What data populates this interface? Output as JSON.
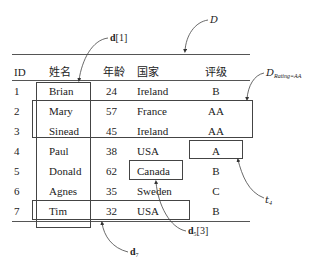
{
  "table": {
    "headers": {
      "id": "ID",
      "name": "姓名",
      "age": "年龄",
      "country": "国家",
      "rating": "评级"
    },
    "rows": [
      {
        "id": "1",
        "name": "Brian",
        "age": "24",
        "country": "Ireland",
        "rating": "B"
      },
      {
        "id": "2",
        "name": "Mary",
        "age": "57",
        "country": "France",
        "rating": "AA"
      },
      {
        "id": "3",
        "name": "Sinead",
        "age": "45",
        "country": "Ireland",
        "rating": "AA"
      },
      {
        "id": "4",
        "name": "Paul",
        "age": "38",
        "country": "USA",
        "rating": "A"
      },
      {
        "id": "5",
        "name": "Donald",
        "age": "62",
        "country": "Canada",
        "rating": "B"
      },
      {
        "id": "6",
        "name": "Agnes",
        "age": "35",
        "country": "Sweden",
        "rating": "C"
      },
      {
        "id": "7",
        "name": "Tim",
        "age": "32",
        "country": "USA",
        "rating": "B"
      }
    ]
  },
  "annotations": {
    "dataset": "D",
    "subset": {
      "symbol": "D",
      "subscript": "Rating=AA"
    },
    "column": {
      "symbol": "d",
      "index": "[1]"
    },
    "row": {
      "symbol": "d",
      "subscript": "7"
    },
    "cell": {
      "symbol": "d",
      "subscript": "5",
      "index": "[3]"
    },
    "tuple": {
      "symbol": "t",
      "subscript": "4"
    }
  },
  "colors": {
    "line": "#555555",
    "text": "#222222"
  }
}
